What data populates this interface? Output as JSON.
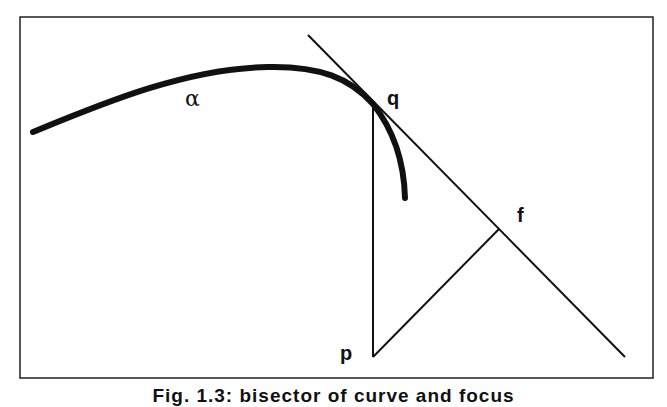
{
  "figure": {
    "caption": "Fig. 1.3: bisector of curve and focus",
    "labels": {
      "curve": "α",
      "tangent_point": "q",
      "foot_point": "f",
      "base_point": "p"
    },
    "colors": {
      "stroke": "#111111",
      "frame": "#222222",
      "background": "#ffffff"
    }
  }
}
